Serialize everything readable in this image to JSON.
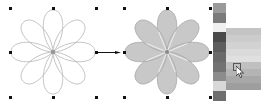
{
  "canvas": {
    "background": "#ffffff",
    "handle_color": "#111111",
    "left_selection": {
      "handles": [
        {
          "x": 9,
          "y": 7
        },
        {
          "x": 52,
          "y": 7
        },
        {
          "x": 95,
          "y": 7
        },
        {
          "x": 9,
          "y": 51
        },
        {
          "x": 95,
          "y": 51
        },
        {
          "x": 9,
          "y": 96
        },
        {
          "x": 52,
          "y": 96
        },
        {
          "x": 95,
          "y": 96
        }
      ]
    },
    "right_selection": {
      "handles": [
        {
          "x": 123,
          "y": 7
        },
        {
          "x": 166,
          "y": 7
        },
        {
          "x": 209,
          "y": 7
        },
        {
          "x": 123,
          "y": 51
        },
        {
          "x": 209,
          "y": 51
        },
        {
          "x": 123,
          "y": 96
        },
        {
          "x": 166,
          "y": 96
        },
        {
          "x": 209,
          "y": 96
        }
      ]
    }
  },
  "shapes": {
    "outline_flower": {
      "petals": 8,
      "fill": "none",
      "stroke": "#b8b8b8",
      "center_color": "#9a9a9a"
    },
    "filled_flower": {
      "petals": 8,
      "fill": "#c8c8c8",
      "stroke": "#a8a8a8",
      "center_color": "#888888"
    },
    "arrow": {
      "color": "#111111",
      "direction": "right"
    }
  },
  "palette": {
    "swatches": [
      "#9a9a9a",
      "#7a7a7a",
      "#f0f0f0",
      "#4a4a4a",
      "#5e5e5e",
      "#6a6a6a",
      "#727272",
      "#8c8c8c",
      "#d8d8d8",
      "#6e6e6e"
    ],
    "flyout": {
      "swatches": [
        "#c4c4c4",
        "#cccccc",
        "#d2d2d2",
        "#dadada",
        "#e0e0e0",
        "#c0c0c0",
        "#b4b4b4",
        "#a8a8a8",
        "#9e9e9e"
      ],
      "hovered_index": 5
    }
  },
  "cursor": {
    "type": "arrow-pointer"
  }
}
